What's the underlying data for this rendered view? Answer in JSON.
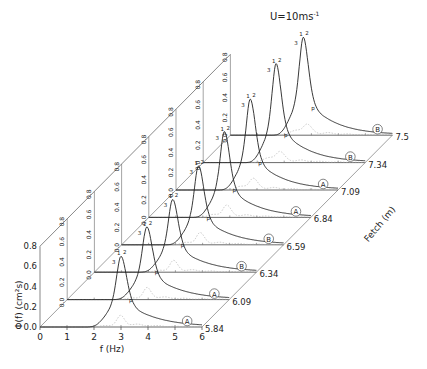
{
  "chart_data": {
    "type": "line",
    "subtype": "waterfall-3d",
    "xlabel": "f (Hz)",
    "ylabel": "Φ(f) (cm²s)",
    "zlabel": "Fetch (m)",
    "xlim": [
      0,
      6
    ],
    "ylim": [
      0,
      0.8
    ],
    "x_ticks": [
      "0",
      "1",
      "2",
      "3",
      "4",
      "5",
      "6"
    ],
    "y_ticks": [
      "0.0",
      "0.2",
      "0.4",
      "0.6",
      "0.8"
    ],
    "grid": false,
    "series": [
      {
        "name": "5.84",
        "marker": "A",
        "peak_f": 3.0,
        "peak_value": 0.7,
        "width": 0.28
      },
      {
        "name": "6.09",
        "marker": "A",
        "peak_f": 2.95,
        "peak_value": 0.72,
        "width": 0.27
      },
      {
        "name": "6.34",
        "marker": "B",
        "peak_f": 2.9,
        "peak_value": 0.72,
        "width": 0.26
      },
      {
        "name": "6.59",
        "marker": "B",
        "peak_f": 2.85,
        "peak_value": 0.78,
        "width": 0.26
      },
      {
        "name": "6.84",
        "marker": "A",
        "peak_f": 2.8,
        "peak_value": 0.85,
        "width": 0.25
      },
      {
        "name": "7.09",
        "marker": "A",
        "peak_f": 2.75,
        "peak_value": 0.9,
        "width": 0.25
      },
      {
        "name": "7.34",
        "marker": "B",
        "peak_f": 2.7,
        "peak_value": 0.98,
        "width": 0.24
      },
      {
        "name": "7.59",
        "marker": "B",
        "peak_f": 2.7,
        "peak_value": 0.97,
        "width": 0.24
      }
    ],
    "fetch_labels": [
      "5.84",
      "6.09",
      "6.34",
      "6.59",
      "6.84",
      "7.09",
      "7.34",
      "7.5"
    ],
    "annotations": [
      "1",
      "2",
      "3",
      "4",
      "p",
      "a",
      "b"
    ]
  },
  "labels": {
    "title": "U=10ms",
    "title_sup": "-1",
    "xlabel": "f (Hz)",
    "ylabel": "Φ(f) (cm²s)",
    "zlabel": "Fetch (m)"
  }
}
